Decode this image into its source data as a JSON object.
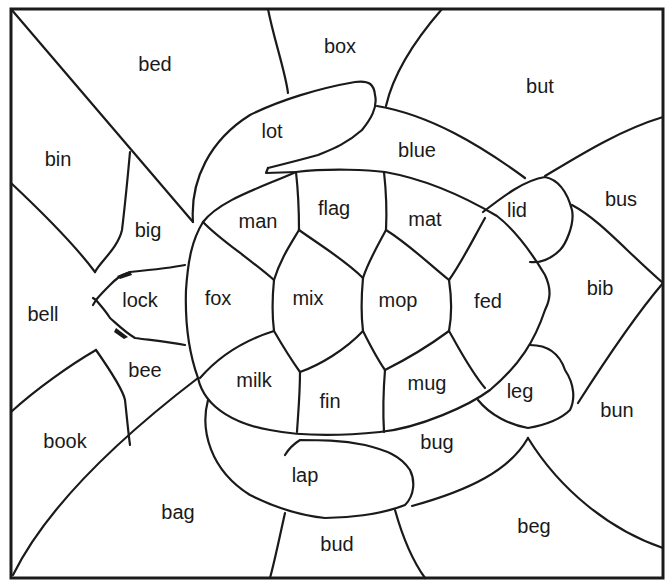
{
  "worksheet": {
    "subject": "turtle",
    "line_color": "#1a1a1a",
    "background": "#ffffff",
    "regions": [
      {
        "word": "bed",
        "x": 155,
        "y": 66,
        "area": "background"
      },
      {
        "word": "box",
        "x": 340,
        "y": 48,
        "area": "background"
      },
      {
        "word": "but",
        "x": 540,
        "y": 88,
        "area": "background"
      },
      {
        "word": "lot",
        "x": 272,
        "y": 133,
        "area": "turtle-front-flipper-top"
      },
      {
        "word": "blue",
        "x": 417,
        "y": 152,
        "area": "background"
      },
      {
        "word": "bin",
        "x": 58,
        "y": 161,
        "area": "background"
      },
      {
        "word": "bus",
        "x": 621,
        "y": 201,
        "area": "background"
      },
      {
        "word": "lid",
        "x": 517,
        "y": 212,
        "area": "turtle-back-flipper-top"
      },
      {
        "word": "man",
        "x": 258,
        "y": 223,
        "area": "turtle-shell"
      },
      {
        "word": "flag",
        "x": 334,
        "y": 210,
        "area": "turtle-shell"
      },
      {
        "word": "mat",
        "x": 425,
        "y": 221,
        "area": "turtle-shell"
      },
      {
        "word": "big",
        "x": 148,
        "y": 232,
        "area": "background"
      },
      {
        "word": "bib",
        "x": 600,
        "y": 290,
        "area": "background"
      },
      {
        "word": "bell",
        "x": 43,
        "y": 316,
        "area": "background"
      },
      {
        "word": "lock",
        "x": 140,
        "y": 302,
        "area": "turtle-head"
      },
      {
        "word": "fox",
        "x": 218,
        "y": 300,
        "area": "turtle-shell"
      },
      {
        "word": "mix",
        "x": 308,
        "y": 300,
        "area": "turtle-shell"
      },
      {
        "word": "mop",
        "x": 398,
        "y": 302,
        "area": "turtle-shell"
      },
      {
        "word": "fed",
        "x": 488,
        "y": 303,
        "area": "turtle-shell"
      },
      {
        "word": "bee",
        "x": 145,
        "y": 372,
        "area": "background"
      },
      {
        "word": "milk",
        "x": 254,
        "y": 382,
        "area": "turtle-shell"
      },
      {
        "word": "mug",
        "x": 427,
        "y": 385,
        "area": "turtle-shell"
      },
      {
        "word": "fin",
        "x": 330,
        "y": 403,
        "area": "turtle-shell"
      },
      {
        "word": "leg",
        "x": 520,
        "y": 393,
        "area": "turtle-back-flipper-bottom"
      },
      {
        "word": "bun",
        "x": 617,
        "y": 412,
        "area": "background"
      },
      {
        "word": "book",
        "x": 65,
        "y": 443,
        "area": "background"
      },
      {
        "word": "bug",
        "x": 437,
        "y": 444,
        "area": "turtle-front-flipper-bottom"
      },
      {
        "word": "lap",
        "x": 305,
        "y": 477,
        "area": "turtle-front-flipper-bottom"
      },
      {
        "word": "bag",
        "x": 178,
        "y": 514,
        "area": "background"
      },
      {
        "word": "beg",
        "x": 534,
        "y": 528,
        "area": "background"
      },
      {
        "word": "bud",
        "x": 337,
        "y": 546,
        "area": "background"
      }
    ]
  }
}
